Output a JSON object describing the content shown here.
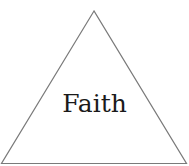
{
  "diagram": {
    "shape": "triangle",
    "label": "Faith",
    "stroke_color": "#7a7a7a",
    "text_color": "#1a1a1a",
    "vertices": {
      "apex": [
        94,
        11
      ],
      "bottom_left": [
        1.5,
        163.5
      ],
      "bottom_right": [
        186.5,
        163.5
      ]
    }
  }
}
